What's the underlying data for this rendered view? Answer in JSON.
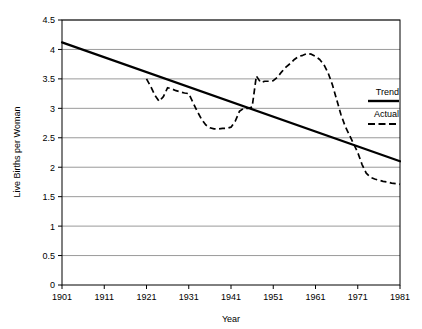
{
  "chart_data": {
    "type": "line",
    "title": "",
    "xlabel": "Year",
    "ylabel": "Live Births per Woman",
    "xlim": [
      1901,
      1981
    ],
    "ylim": [
      0,
      4.5
    ],
    "grid": true,
    "grid_axis": "y",
    "legend_position": "right-outside",
    "xticks": [
      "1901",
      "1911",
      "1921",
      "1931",
      "1941",
      "1951",
      "1961",
      "1971",
      "1981"
    ],
    "yticks": [
      "0",
      "0.5",
      "1",
      "1.5",
      "2",
      "2.5",
      "3",
      "3.5",
      "4",
      "4.5"
    ],
    "series": [
      {
        "name": "Trend",
        "style": "solid",
        "color": "#000000",
        "x": [
          1901,
          1981
        ],
        "values": [
          4.12,
          2.1
        ]
      },
      {
        "name": "Actual",
        "style": "dashed",
        "color": "#000000",
        "x": [
          1921,
          1922,
          1923,
          1924,
          1925,
          1926,
          1927,
          1928,
          1929,
          1930,
          1931,
          1932,
          1933,
          1934,
          1935,
          1936,
          1937,
          1938,
          1939,
          1940,
          1941,
          1942,
          1943,
          1944,
          1945,
          1946,
          1947,
          1948,
          1949,
          1950,
          1951,
          1952,
          1953,
          1954,
          1955,
          1956,
          1957,
          1958,
          1959,
          1960,
          1961,
          1962,
          1963,
          1964,
          1965,
          1966,
          1967,
          1968,
          1969,
          1970,
          1971,
          1972,
          1973,
          1974,
          1975,
          1976,
          1977,
          1978,
          1979,
          1980,
          1981
        ],
        "values": [
          3.5,
          3.37,
          3.22,
          3.12,
          3.2,
          3.35,
          3.33,
          3.3,
          3.28,
          3.26,
          3.25,
          3.1,
          2.95,
          2.82,
          2.72,
          2.67,
          2.65,
          2.65,
          2.66,
          2.66,
          2.68,
          2.78,
          2.95,
          3.0,
          3.0,
          3.02,
          3.55,
          3.44,
          3.46,
          3.46,
          3.47,
          3.53,
          3.62,
          3.7,
          3.76,
          3.83,
          3.88,
          3.9,
          3.93,
          3.92,
          3.88,
          3.83,
          3.74,
          3.6,
          3.4,
          3.15,
          2.9,
          2.7,
          2.55,
          2.4,
          2.25,
          2.05,
          1.9,
          1.83,
          1.8,
          1.78,
          1.76,
          1.75,
          1.73,
          1.72,
          1.71
        ]
      }
    ]
  },
  "legend": {
    "items": [
      {
        "label": "Trend",
        "style": "solid"
      },
      {
        "label": "Actual",
        "style": "dashed"
      }
    ]
  }
}
